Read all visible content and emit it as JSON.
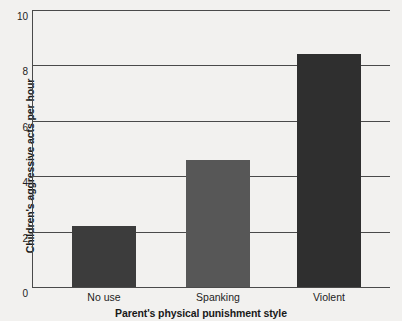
{
  "chart_data": {
    "type": "bar",
    "title": "",
    "categories": [
      "No use",
      "Spanking",
      "Violent"
    ],
    "values": [
      2.2,
      4.6,
      8.4
    ],
    "series": [
      {
        "name": "Children's aggressive acts per hour",
        "values": [
          2.2,
          4.6,
          8.4
        ]
      }
    ],
    "xlabel": "Parent's physical punishment style",
    "ylabel": "Children's aggressive acts per hour",
    "ylim": [
      0,
      10
    ],
    "yticks": [
      0,
      2,
      4,
      6,
      8,
      10
    ],
    "ytick_labels": [
      "0",
      "2",
      "4",
      "6",
      "8",
      "10"
    ],
    "grid": true,
    "grid_axis": "y",
    "legend": false,
    "legend_position": "none",
    "bar_colors": [
      "#3c3c3c",
      "#575757",
      "#2f2f2f"
    ],
    "background_color": "#f2f1ef",
    "axis_color": "#4a4a4a"
  },
  "axes": {
    "y_title": "Children's aggressive acts per hour",
    "x_title": "Parent's physical punishment style"
  },
  "ticks": {
    "y": [
      {
        "label": "10",
        "value": 10
      },
      {
        "label": "8",
        "value": 8
      },
      {
        "label": "6",
        "value": 6
      },
      {
        "label": "4",
        "value": 4
      },
      {
        "label": "2",
        "value": 2
      },
      {
        "label": "0",
        "value": 0
      }
    ],
    "x": [
      {
        "label": "No use"
      },
      {
        "label": "Spanking"
      },
      {
        "label": "Violent"
      }
    ]
  },
  "bars": [
    {
      "label": "No use",
      "value": 2.2,
      "color": "#3c3c3c"
    },
    {
      "label": "Spanking",
      "value": 4.6,
      "color": "#575757"
    },
    {
      "label": "Violent",
      "value": 8.4,
      "color": "#2f2f2f"
    }
  ]
}
